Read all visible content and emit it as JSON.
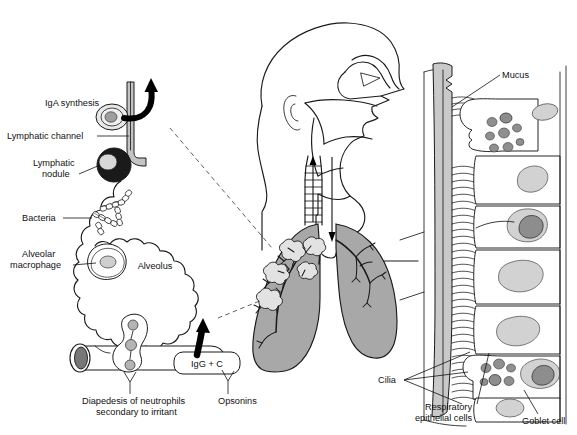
{
  "figure": {
    "background_color": "#ffffff",
    "ink_color": "#1a1a1a",
    "lung_fill_color": "#a8a8a8",
    "mucus_fill_color": "#c9c9c9"
  },
  "left_panel": {
    "name": "alveolus-detail",
    "labels": {
      "iga_synthesis": "IgA synthesis",
      "lymphatic_channel": "Lymphatic channel",
      "lymphatic_nodule_line1": "Lymphatic",
      "lymphatic_nodule_line2": "nodule",
      "bacteria": "Bacteria",
      "alveolar_macrophage_line1": "Alveolar",
      "alveolar_macrophage_line2": "macrophage",
      "alveolus": "Alveolus",
      "igg_c": "IgG + C",
      "diapedesis_line1": "Diapedesis of neutrophils",
      "diapedesis_line2": "secondary to irritant",
      "opsonins": "Opsonins"
    }
  },
  "center_panel": {
    "name": "head-and-lungs",
    "structures": [
      "sagittal head outline",
      "nasal cavity",
      "pharynx",
      "trachea",
      "left lung",
      "right lung",
      "bronchial tree",
      "alveolar clusters"
    ],
    "airflow_arrows": {
      "up_label": "ascending mucociliary clearance",
      "down_label": "inspired air"
    }
  },
  "right_panel": {
    "name": "respiratory-epithelium-detail",
    "labels": {
      "mucus": "Mucus",
      "cilia": "Cilia",
      "respiratory_epithelial_cells_line1": "Respiratory",
      "respiratory_epithelial_cells_line2": "epithelial cells",
      "goblet_cell": "Goblet cell"
    }
  }
}
